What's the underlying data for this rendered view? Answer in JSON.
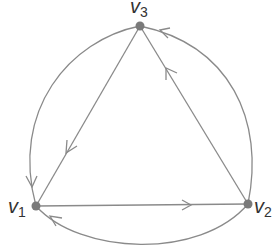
{
  "diagram": {
    "type": "directed-graph",
    "edge_color": "#8a8a8a",
    "node_color": "#7a7a7a",
    "vertices": [
      {
        "id": "v1",
        "name": "v",
        "sub": "1",
        "x": 36,
        "y": 206
      },
      {
        "id": "v2",
        "name": "v",
        "sub": "2",
        "x": 248,
        "y": 204
      },
      {
        "id": "v3",
        "name": "v",
        "sub": "3",
        "x": 140,
        "y": 26
      }
    ],
    "edges": [
      {
        "from": "v3",
        "to": "v1",
        "kind": "straight"
      },
      {
        "from": "v1",
        "to": "v2",
        "kind": "straight"
      },
      {
        "from": "v2",
        "to": "v3",
        "kind": "straight"
      },
      {
        "from": "v3",
        "to": "v1",
        "kind": "arc-left"
      },
      {
        "from": "v2",
        "to": "v3",
        "kind": "arc-right"
      },
      {
        "from": "v2",
        "to": "v1",
        "kind": "arc-bottom"
      }
    ]
  }
}
